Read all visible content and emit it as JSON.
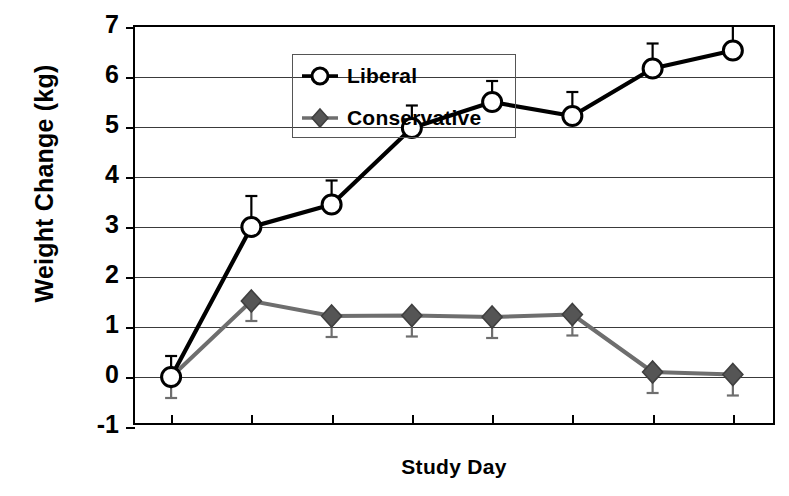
{
  "chart_data": {
    "type": "line",
    "title": "",
    "xlabel": "Study Day",
    "ylabel": "Weight Change (kg)",
    "x": [
      0,
      1,
      2,
      3,
      4,
      5,
      6,
      7
    ],
    "xticklabels": [
      "0",
      "1",
      "2",
      "3",
      "4",
      "5",
      "6",
      "7"
    ],
    "yticklabels": [
      "-1",
      "0",
      "1",
      "2",
      "3",
      "4",
      "5",
      "6",
      "7"
    ],
    "yticks": [
      -1,
      0,
      1,
      2,
      3,
      4,
      5,
      6,
      7
    ],
    "xlim": [
      -0.45,
      7.55
    ],
    "ylim": [
      -1,
      7
    ],
    "grid": true,
    "grid_axis": "y",
    "legend_position": "upper-left-inside",
    "series": [
      {
        "name": "Liberal",
        "marker": "open-circle",
        "color": "#000000",
        "marker_fill": "#ffffff",
        "values": [
          0.0,
          3.0,
          3.45,
          4.98,
          5.5,
          5.22,
          6.17,
          6.53
        ],
        "errors": [
          0.42,
          0.62,
          0.48,
          0.45,
          0.42,
          0.48,
          0.5,
          0.5
        ],
        "error_direction": "up"
      },
      {
        "name": "Conservative",
        "marker": "filled-diamond",
        "color": "#6e6e6e",
        "marker_fill": "#555555",
        "values": [
          0.0,
          1.52,
          1.22,
          1.23,
          1.2,
          1.25,
          0.1,
          0.05
        ],
        "errors": [
          0.42,
          0.4,
          0.42,
          0.42,
          0.42,
          0.42,
          0.42,
          0.42
        ],
        "error_direction": "down"
      }
    ]
  },
  "legend": {
    "items": [
      {
        "label": "Liberal"
      },
      {
        "label": "Conservative"
      }
    ]
  }
}
